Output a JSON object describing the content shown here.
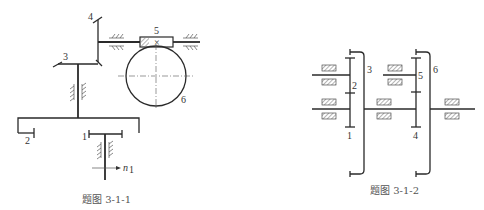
{
  "figure_left": {
    "caption": "题图 3-1-1",
    "labels": {
      "gear1": "1",
      "gear2": "2",
      "gear3": "3",
      "gear4": "4",
      "worm5": "5",
      "wormwheel6": "6",
      "input_speed": "n",
      "input_speed_sub": "1"
    }
  },
  "figure_right": {
    "caption": "题图 3-1-2",
    "labels": {
      "gear1": "1",
      "gear2": "2",
      "gear3": "3",
      "gear4": "4",
      "gear5": "5",
      "gear6": "6"
    }
  }
}
